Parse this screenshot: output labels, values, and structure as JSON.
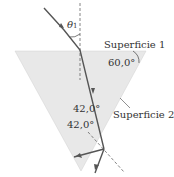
{
  "diagram": {
    "labels": {
      "theta": "θ",
      "theta_sub": "1",
      "surface1": "Superficie 1",
      "surface2": "Superficie 2",
      "angle_top": "60,0°",
      "angle_mid1": "42,0°",
      "angle_mid2": "42,0°"
    },
    "colors": {
      "prism_fill": "#e6e6e6",
      "ray": "#555555",
      "dashed": "#666666"
    }
  }
}
